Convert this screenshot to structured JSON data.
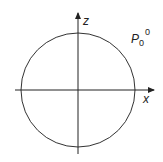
{
  "diagram": {
    "label_main": "P",
    "label_sub": "0",
    "label_sup": "0",
    "axes": {
      "x_label": "x",
      "z_label": "z"
    },
    "shape": {
      "type": "circle",
      "center": [
        78,
        90
      ],
      "radius": 57
    },
    "colors": {
      "stroke": "#333333",
      "background": "#ffffff"
    }
  }
}
